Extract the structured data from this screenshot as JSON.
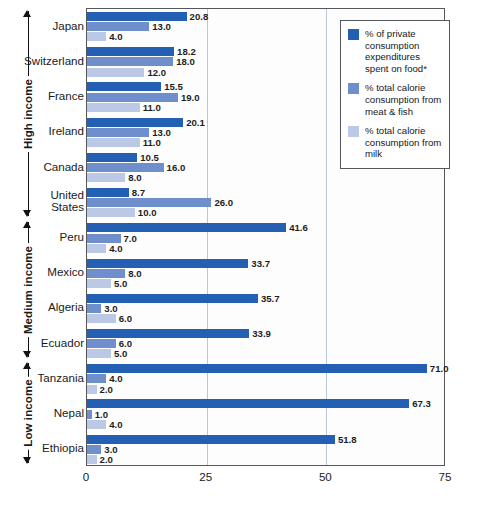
{
  "chart_data": {
    "type": "bar",
    "orientation": "horizontal",
    "title": "",
    "xlabel": "",
    "ylabel": "",
    "xlim": [
      0,
      75
    ],
    "xticks": [
      "0",
      "25",
      "50",
      "75"
    ],
    "xtick_values": [
      0,
      25,
      50,
      75
    ],
    "grid": true,
    "legend_position": "top-right",
    "categories": [
      "Japan",
      "Switzerland",
      "France",
      "Ireland",
      "Canada",
      "United States",
      "Peru",
      "Mexico",
      "Algeria",
      "Ecuador",
      "Tanzania",
      "Nepal",
      "Ethiopia"
    ],
    "series": [
      {
        "name": "% of private consumption expenditures spent on food*",
        "color": "#2360b4",
        "values": [
          20.8,
          18.2,
          15.5,
          20.1,
          10.5,
          8.7,
          41.6,
          33.7,
          35.7,
          33.9,
          71.0,
          67.3,
          51.8
        ],
        "labels": [
          "20.8",
          "18.2",
          "15.5",
          "20.1",
          "10.5",
          "8.7",
          "41.6",
          "33.7",
          "35.7",
          "33.9",
          "71.0",
          "67.3",
          "51.8"
        ]
      },
      {
        "name": "% total calorie consumption from meat & fish",
        "color": "#6e8fcb",
        "values": [
          13.0,
          18.0,
          19.0,
          13.0,
          16.0,
          26.0,
          7.0,
          8.0,
          3.0,
          6.0,
          4.0,
          1.0,
          3.0
        ],
        "labels": [
          "13.0",
          "18.0",
          "19.0",
          "13.0",
          "16.0",
          "26.0",
          "7.0",
          "8.0",
          "3.0",
          "6.0",
          "4.0",
          "1.0",
          "3.0"
        ]
      },
      {
        "name": "% total calorie consumption from milk",
        "color": "#bcc9e6",
        "values": [
          4.0,
          12.0,
          11.0,
          11.0,
          8.0,
          10.0,
          4.0,
          5.0,
          6.0,
          5.0,
          2.0,
          4.0,
          2.0
        ],
        "labels": [
          "4.0",
          "12.0",
          "11.0",
          "11.0",
          "8.0",
          "10.0",
          "4.0",
          "5.0",
          "6.0",
          "5.0",
          "2.0",
          "4.0",
          "2.0"
        ]
      }
    ],
    "groups": [
      {
        "label": "High income",
        "first": 0,
        "last": 5
      },
      {
        "label": "Medium income",
        "first": 6,
        "last": 9
      },
      {
        "label": "Low income",
        "first": 10,
        "last": 12
      }
    ]
  },
  "legend": {
    "items": [
      {
        "label": "% of private consumption expenditures spent on food*",
        "color": "#2360b4"
      },
      {
        "label": "% total calorie consumption from meat & fish",
        "color": "#6e8fcb"
      },
      {
        "label": "% total calorie consumption from milk",
        "color": "#bcc9e6"
      }
    ]
  }
}
